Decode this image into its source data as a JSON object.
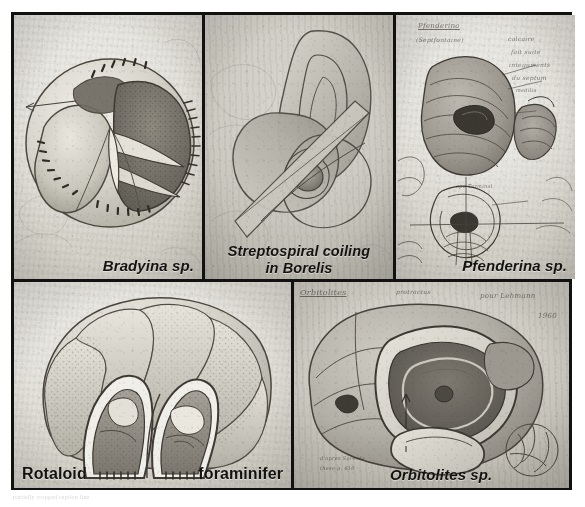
{
  "plate": {
    "title": "Foraminifera drawings plate",
    "background_color": "#ffffff",
    "frame_color": "#111111",
    "panel_count": 5
  },
  "panels": [
    {
      "id": "bradyina",
      "label": "Bradyina sp.",
      "label_style": "bold-italic",
      "label_position": "bottom-right",
      "subject": "pencil drawing of a cutaway globular foraminifer test with perforated chamber walls and arrow annotation",
      "paper_tone": "light"
    },
    {
      "id": "borelis",
      "label_line1": "Streptospiral coiling",
      "label_line2": "in Borelis",
      "label_style": "bold-italic",
      "label_position": "bottom-center",
      "subject": "pencil diagram of streptospiral coiling showing interlocking loops around a central spiral node",
      "paper_tone": "medium"
    },
    {
      "id": "pfenderina",
      "label": "Pfenderina sp.",
      "label_style": "bold-italic",
      "label_position": "bottom-right",
      "subject": "pencil sketch sheet with conical coiled test, detail view and axial section, annotated in cursive",
      "paper_tone": "dark",
      "handwritten_notes": [
        "Pfenderina",
        "(Septfontaine)",
        "calcaire",
        "fait suite",
        "integuments",
        "du septum",
        "medilia",
        "opa-Terminal"
      ]
    },
    {
      "id": "rotaloid",
      "label_left": "Rotaloid",
      "label_right": "foraminifer",
      "label_style": "bold-upright",
      "label_position": "bottom-split",
      "subject": "large shaded pencil drawing of a rotaloid foraminifer with two chambers cut open showing perforate walls",
      "paper_tone": "light"
    },
    {
      "id": "orbitolites",
      "label": "Orbitolites sp.",
      "label_style": "bold-italic",
      "label_position": "bottom-center-right",
      "subject": "pencil drawing of a discoidal Orbitolites test cut open to reveal annular chamberlets, with small circular inset sketch",
      "paper_tone": "medium",
      "handwritten_notes": [
        "Orbitolites",
        "protractus",
        "pour Lehmann",
        "1960",
        "d'apres Sorento",
        "these p. 610"
      ]
    }
  ],
  "footnote": {
    "text": "partially cropped caption line"
  }
}
